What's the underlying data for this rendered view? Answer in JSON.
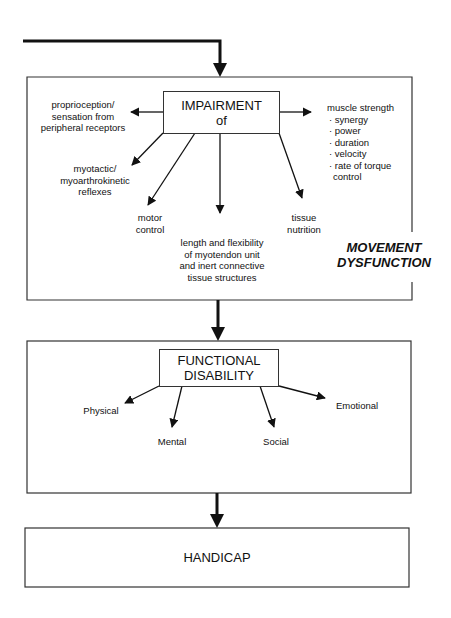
{
  "diagram": {
    "impairment_section": {
      "box_title": [
        "IMPAIRMENT",
        "of"
      ],
      "side_label": [
        "MOVEMENT",
        "DYSFUNCTION"
      ],
      "branches": [
        {
          "id": "proprioception",
          "lines": [
            "proprioception/",
            "sensation from",
            "peripheral receptors"
          ]
        },
        {
          "id": "reflexes",
          "lines": [
            "myotactic/",
            "myoarthrokinetic",
            "reflexes"
          ]
        },
        {
          "id": "motor-control",
          "lines": [
            "motor",
            "control"
          ]
        },
        {
          "id": "length-flexibility",
          "lines": [
            "length and flexibility",
            "of myotendon unit",
            "and inert connective",
            "tissue structures"
          ]
        },
        {
          "id": "tissue-nutrition",
          "lines": [
            "tissue",
            "nutrition"
          ]
        },
        {
          "id": "muscle-strength",
          "title": "muscle strength",
          "items": [
            "· synergy",
            "· power",
            "· duration",
            "· velocity",
            "· rate of torque",
            "control"
          ]
        }
      ]
    },
    "functional_section": {
      "box_title": [
        "FUNCTIONAL",
        "DISABILITY"
      ],
      "branches": [
        "Physical",
        "Mental",
        "Social",
        "Emotional"
      ]
    },
    "handicap_section": {
      "box_title": "HANDICAP"
    },
    "colors": {
      "line": "#111111",
      "border": "#333333",
      "background": "#ffffff"
    }
  }
}
